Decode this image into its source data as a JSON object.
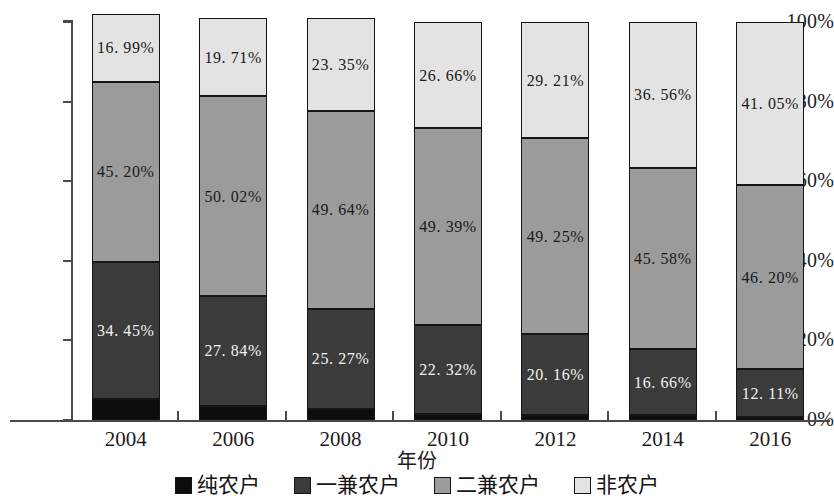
{
  "chart_data": {
    "type": "bar",
    "subtype": "stacked-percentage-column",
    "title": "",
    "xlabel": "年份",
    "ylabel": "",
    "categories": [
      "2004",
      "2006",
      "2008",
      "2010",
      "2012",
      "2014",
      "2016"
    ],
    "ylim": [
      0,
      100
    ],
    "ytick_labels": [
      "0%",
      "20%",
      "40%",
      "60%",
      "80%",
      "100%"
    ],
    "ytick_values": [
      0,
      20,
      40,
      60,
      80,
      100
    ],
    "grid": false,
    "legend_position": "bottom",
    "stack_order_bottom_to_top": [
      "纯农户",
      "一兼农户",
      "二兼农户",
      "非农户"
    ],
    "series": [
      {
        "name": "纯农户",
        "color": "#0d0d0d",
        "label_color": "light",
        "values": [
          5.36,
          3.43,
          2.74,
          1.63,
          1.38,
          1.2,
          0.64
        ],
        "labels": [
          "",
          "",
          "",
          "",
          "",
          "",
          ""
        ]
      },
      {
        "name": "一兼农户",
        "color": "#3b3b3b",
        "label_color": "light",
        "values": [
          34.45,
          27.84,
          25.27,
          22.32,
          20.16,
          16.66,
          12.11
        ],
        "labels": [
          "34. 45%",
          "27. 84%",
          "25. 27%",
          "22. 32%",
          "20. 16%",
          "16. 66%",
          "12. 11%"
        ]
      },
      {
        "name": "二兼农户",
        "color": "#9b9b9b",
        "label_color": "dark",
        "values": [
          45.2,
          50.02,
          49.64,
          49.39,
          49.25,
          45.58,
          46.2
        ],
        "labels": [
          "45. 20%",
          "50. 02%",
          "49. 64%",
          "49. 39%",
          "49. 25%",
          "45. 58%",
          "46. 20%"
        ]
      },
      {
        "name": "非农户",
        "color": "#e3e3e3",
        "label_color": "dark",
        "values": [
          16.99,
          19.71,
          23.35,
          26.66,
          29.21,
          36.56,
          41.05
        ],
        "labels": [
          "16. 99%",
          "19. 71%",
          "23. 35%",
          "26. 66%",
          "29. 21%",
          "36. 56%",
          "41. 05%"
        ]
      }
    ]
  },
  "axis": {
    "x_title": "年份"
  },
  "legend": {
    "items": [
      {
        "label": "纯农户",
        "color": "#0d0d0d"
      },
      {
        "label": "一兼农户",
        "color": "#3b3b3b"
      },
      {
        "label": "二兼农户",
        "color": "#9b9b9b"
      },
      {
        "label": "非农户",
        "color": "#e3e3e3"
      }
    ]
  }
}
